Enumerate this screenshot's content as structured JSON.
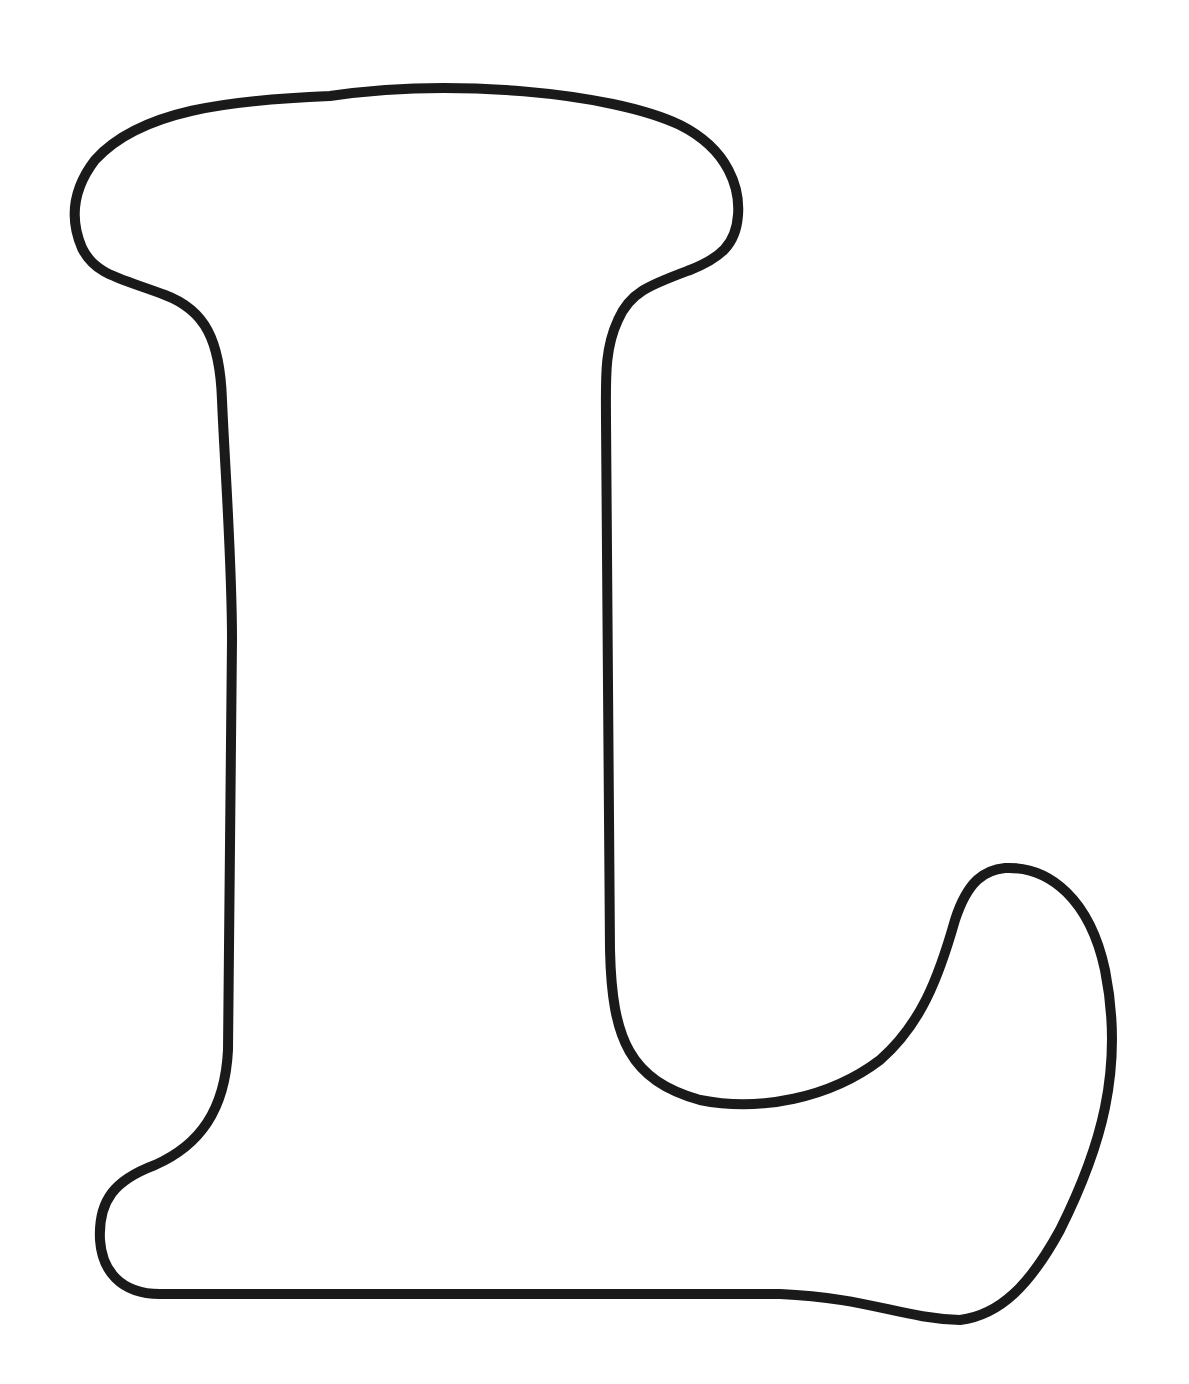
{
  "figure": {
    "letter": "L",
    "style": "outline",
    "stroke_color": "#1a1a1a",
    "fill_color": "#ffffff",
    "background": "#ffffff"
  }
}
